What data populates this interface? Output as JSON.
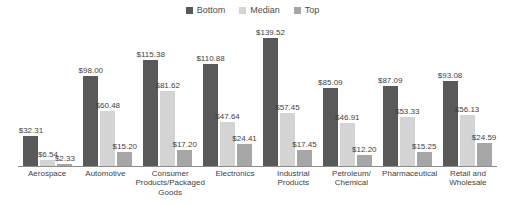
{
  "legend": {
    "position": "top-center",
    "items": [
      {
        "label": "Bottom",
        "color": "#595959",
        "swatch_name": "legend-swatch-bottom"
      },
      {
        "label": "Median",
        "color": "#d4d4d4",
        "swatch_name": "legend-swatch-median"
      },
      {
        "label": "Top",
        "color": "#a6a6a6",
        "swatch_name": "legend-swatch-top"
      }
    ]
  },
  "axis": {
    "baseline_color": "#8c8c8c",
    "grid": false
  },
  "chart_data": {
    "type": "bar",
    "title": "",
    "subtitle": "",
    "xlabel": "",
    "ylabel": "",
    "ylim": [
      0,
      145
    ],
    "grid": false,
    "legend_position": "top-center",
    "value_prefix": "$",
    "categories": [
      "Aerospace",
      "Automotive",
      "Consumer\nProducts/Packaged\nGoods",
      "Electronics",
      "Industrial\nProducts",
      "Petroleum/\nChemical",
      "Pharmaceutical",
      "Retail and\nWholesale"
    ],
    "series": [
      {
        "name": "Bottom",
        "color": "#595959",
        "values": [
          32.31,
          98.0,
          115.38,
          110.88,
          139.52,
          85.09,
          87.09,
          93.08
        ],
        "labels": [
          "$32.31",
          "$98.00",
          "$115.38",
          "$110.88",
          "$139.52",
          "$85.09",
          "$87.09",
          "$93.08"
        ]
      },
      {
        "name": "Median",
        "color": "#d4d4d4",
        "values": [
          6.54,
          60.48,
          81.62,
          47.64,
          57.45,
          46.91,
          53.33,
          56.13
        ],
        "labels": [
          "$6.54",
          "$60.48",
          "$81.62",
          "$47.64",
          "$57.45",
          "$46.91",
          "$53.33",
          "$56.13"
        ]
      },
      {
        "name": "Top",
        "color": "#a6a6a6",
        "values": [
          2.33,
          15.2,
          17.2,
          24.41,
          17.45,
          12.2,
          15.25,
          24.59
        ],
        "labels": [
          "$2.33",
          "$15.20",
          "$17.20",
          "$24.41",
          "$17.45",
          "$12.20",
          "$15.25",
          "$24.59"
        ]
      }
    ]
  }
}
